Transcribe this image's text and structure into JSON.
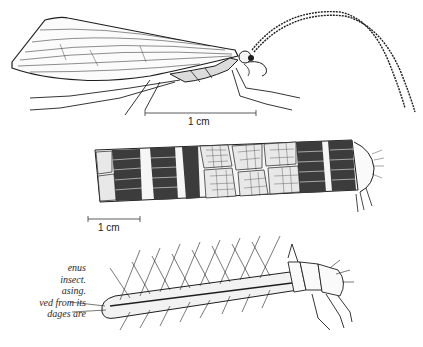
{
  "figure": {
    "panels": [
      {
        "name": "adult",
        "description": "adult insect, side view, with long antennae"
      },
      {
        "name": "case",
        "description": "larval case built of plant fragments, larva head emerging"
      },
      {
        "name": "larva",
        "description": "larva removed from its case, with setae"
      }
    ],
    "scale_bars": [
      {
        "label": "1 cm"
      },
      {
        "label": "1 cm"
      }
    ],
    "caption_lines": [
      "enus",
      "insect.",
      "asing.",
      "ved from its",
      "dages are"
    ],
    "colors": {
      "ink": "#1e1e1e",
      "paper": "#ffffff",
      "caption": "#2a2a2a"
    }
  }
}
